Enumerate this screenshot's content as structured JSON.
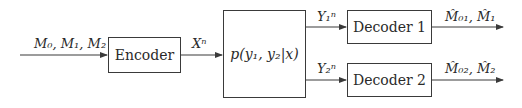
{
  "diagram": {
    "type": "block-diagram",
    "title": "",
    "nodes": [
      {
        "id": "encoder",
        "label": "Encoder"
      },
      {
        "id": "channel",
        "label": "p(y₁, y₂|x)"
      },
      {
        "id": "decoder1",
        "label": "Decoder 1"
      },
      {
        "id": "decoder2",
        "label": "Decoder 2"
      }
    ],
    "edges": [
      {
        "from": "input",
        "to": "encoder",
        "label": "M₀, M₁, M₂"
      },
      {
        "from": "encoder",
        "to": "channel",
        "label": "Xⁿ"
      },
      {
        "from": "channel",
        "to": "decoder1",
        "label": "Y₁ⁿ"
      },
      {
        "from": "channel",
        "to": "decoder2",
        "label": "Y₂ⁿ"
      },
      {
        "from": "decoder1",
        "to": "output1",
        "label": "M̂₀₁, M̂₁"
      },
      {
        "from": "decoder2",
        "to": "output2",
        "label": "M̂₀₂, M̂₂"
      }
    ]
  },
  "labels": {
    "encoder": "Encoder",
    "channel_p": "p",
    "channel_args": "(y₁, y₂|x)",
    "decoder1": "Decoder 1",
    "decoder2": "Decoder 2",
    "input_msgs": "M₀, M₁, M₂",
    "encoder_out": "Xⁿ",
    "y1": "Y₁ⁿ",
    "y2": "Y₂ⁿ",
    "out1": "M̂₀₁, M̂₁",
    "out2": "M̂₀₂, M̂₂"
  },
  "colors": {
    "stroke": "#3a3a3a",
    "text": "#2a2a2a",
    "background": "#ffffff"
  }
}
